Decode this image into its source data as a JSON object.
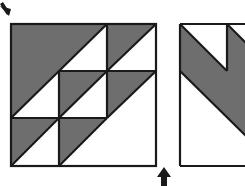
{
  "colors": {
    "shaded": "#6e6e6e",
    "unshaded": "#ffffff",
    "stroke": "#1a1a1a",
    "arrow": "#1a1a1a"
  },
  "figures": [
    {
      "id": "left-square",
      "description": "3x3 grid quilt block of half-square triangles (shaded upper-left halves along down-left diagonals)"
    },
    {
      "id": "right-square",
      "description": "partially visible square with shaded diagonal band running from upper-left to lower-right"
    }
  ],
  "arrows": [
    {
      "id": "top-left-arrow",
      "direction": "down-right"
    },
    {
      "id": "bottom-arrow",
      "direction": "up"
    }
  ]
}
